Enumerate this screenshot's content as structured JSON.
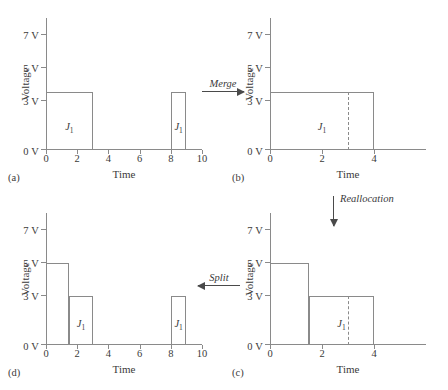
{
  "figure": {
    "axis_titles": {
      "x": "Time",
      "y": "Voltage"
    },
    "y_ticks": [
      "0 V",
      "3 V",
      "5 V",
      "7 V"
    ],
    "y_tick_values": [
      0,
      3,
      5,
      7
    ],
    "y_range": [
      0,
      8
    ],
    "job_label": "J",
    "job_subscript": "1"
  },
  "transitions": {
    "merge": "Merge",
    "split": "Split",
    "reallocation": "Reallocation"
  },
  "panels": {
    "a": {
      "caption": "(a)",
      "x_ticks": [
        "0",
        "2",
        "4",
        "6",
        "8",
        "10"
      ],
      "x_tick_values": [
        0,
        2,
        4,
        6,
        8,
        10
      ],
      "x_range": [
        0,
        10
      ],
      "bars": [
        {
          "label": "J",
          "sub": "1",
          "x_start": 0,
          "x_end": 3,
          "voltage": 3.5
        },
        {
          "label": "J",
          "sub": "1",
          "x_start": 8,
          "x_end": 9,
          "voltage": 3.5
        }
      ],
      "dashed_lines": []
    },
    "b": {
      "caption": "(b)",
      "x_ticks": [
        "0",
        "2",
        "4"
      ],
      "x_tick_values": [
        0,
        2,
        4
      ],
      "x_range": [
        0,
        6
      ],
      "bars": [
        {
          "label": "J",
          "sub": "1",
          "x_start": 0,
          "x_end": 4,
          "voltage": 3.5
        }
      ],
      "dashed_lines": [
        3
      ]
    },
    "c": {
      "caption": "(c)",
      "x_ticks": [
        "0",
        "2",
        "4"
      ],
      "x_tick_values": [
        0,
        2,
        4
      ],
      "x_range": [
        0,
        6
      ],
      "bars": [
        {
          "label": "",
          "sub": "",
          "x_start": 0,
          "x_end": 1.5,
          "voltage": 5
        },
        {
          "label": "J",
          "sub": "1",
          "x_start": 1.5,
          "x_end": 4,
          "voltage": 3
        }
      ],
      "dashed_lines": [
        3
      ]
    },
    "d": {
      "caption": "(d)",
      "x_ticks": [
        "0",
        "2",
        "4",
        "6",
        "8",
        "10"
      ],
      "x_tick_values": [
        0,
        2,
        4,
        6,
        8,
        10
      ],
      "x_range": [
        0,
        10
      ],
      "bars": [
        {
          "label": "",
          "sub": "",
          "x_start": 0,
          "x_end": 1.5,
          "voltage": 5
        },
        {
          "label": "J",
          "sub": "1",
          "x_start": 1.5,
          "x_end": 3,
          "voltage": 3
        },
        {
          "label": "J",
          "sub": "1",
          "x_start": 8,
          "x_end": 9,
          "voltage": 3
        }
      ],
      "dashed_lines": []
    }
  },
  "chart_data": {
    "type": "area",
    "title": "",
    "xlabel": "Time",
    "ylabel": "Voltage",
    "ylim": [
      0,
      8
    ],
    "yticks": [
      0,
      3,
      5,
      7
    ],
    "grid": false,
    "legend": "none",
    "panels": [
      {
        "id": "a",
        "caption": "(a)",
        "xlim": [
          0,
          10
        ],
        "xticks": [
          0,
          2,
          4,
          6,
          8,
          10
        ],
        "segments": [
          {
            "name": "J1",
            "x_start": 0,
            "x_end": 3,
            "y": 3.5
          },
          {
            "name": "J1",
            "x_start": 8,
            "x_end": 9,
            "y": 3.5
          }
        ]
      },
      {
        "id": "b",
        "caption": "(b)",
        "xlim": [
          0,
          6
        ],
        "xticks": [
          0,
          2,
          4
        ],
        "segments": [
          {
            "name": "J1",
            "x_start": 0,
            "x_end": 4,
            "y": 3.5
          }
        ],
        "annotations": [
          {
            "type": "dashed-vline",
            "x": 3
          }
        ]
      },
      {
        "id": "c",
        "caption": "(c)",
        "xlim": [
          0,
          6
        ],
        "xticks": [
          0,
          2,
          4
        ],
        "segments": [
          {
            "name": "J1",
            "x_start": 0,
            "x_end": 1.5,
            "y": 5
          },
          {
            "name": "J1",
            "x_start": 1.5,
            "x_end": 4,
            "y": 3
          }
        ],
        "annotations": [
          {
            "type": "dashed-vline",
            "x": 3
          }
        ]
      },
      {
        "id": "d",
        "caption": "(d)",
        "xlim": [
          0,
          10
        ],
        "xticks": [
          0,
          2,
          4,
          6,
          8,
          10
        ],
        "segments": [
          {
            "name": "J1",
            "x_start": 0,
            "x_end": 1.5,
            "y": 5
          },
          {
            "name": "J1",
            "x_start": 1.5,
            "x_end": 3,
            "y": 3
          },
          {
            "name": "J1",
            "x_start": 8,
            "x_end": 9,
            "y": 3
          }
        ]
      }
    ],
    "transitions": [
      {
        "from": "a",
        "to": "b",
        "label": "Merge",
        "direction": "right"
      },
      {
        "from": "b",
        "to": "c",
        "label": "Reallocation",
        "direction": "down"
      },
      {
        "from": "c",
        "to": "d",
        "label": "Split",
        "direction": "left"
      }
    ]
  }
}
